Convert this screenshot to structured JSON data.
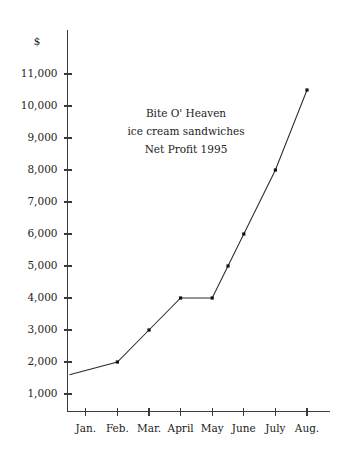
{
  "chart_data": {
    "type": "line",
    "title_lines": [
      "Bite O' Heaven",
      "ice cream sandwiches",
      "Net Profit 1995"
    ],
    "xlabel": "",
    "ylabel": "",
    "y_unit_label": "$",
    "categories": [
      "Jan.",
      "Feb.",
      "Mar.",
      "April",
      "May",
      "June",
      "July",
      "Aug."
    ],
    "values": [
      1600,
      2000,
      3000,
      4000,
      4000,
      6000,
      8000,
      10500
    ],
    "series": [
      {
        "name": "Net Profit 1995",
        "values": [
          1600,
          2000,
          3000,
          4000,
          4000,
          6000,
          8000,
          10500
        ]
      }
    ],
    "extra_points": [
      {
        "label": "May-June midpoint",
        "value": 5000
      }
    ],
    "ylim": [
      0,
      11600
    ],
    "ytick_values": [
      1000,
      2000,
      3000,
      4000,
      5000,
      6000,
      7000,
      8000,
      9000,
      10000,
      11000
    ],
    "ytick_labels": [
      "1,000",
      "2,000",
      "3,000",
      "4,000",
      "5,000",
      "6,000",
      "7,000",
      "8,000",
      "9,000",
      "10,000",
      "11,000"
    ],
    "grid": false,
    "legend": false,
    "legend_position": "none",
    "marker": "square",
    "line_color": "#2b2b2b",
    "marker_color": "#111111",
    "axis_color": "#3b3b3b",
    "background_color": "#ffffff"
  }
}
